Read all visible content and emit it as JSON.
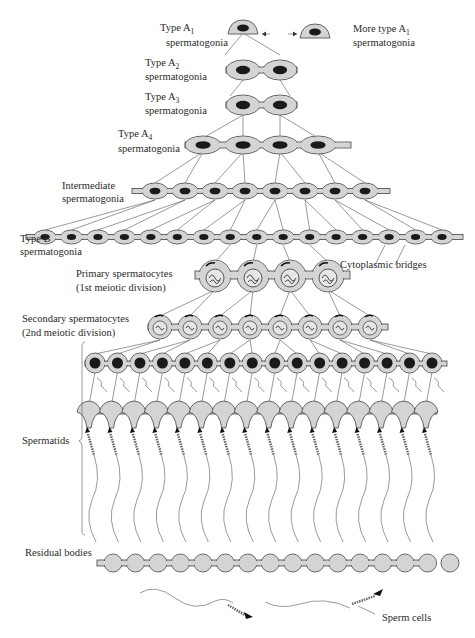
{
  "labels": {
    "type_a1": {
      "line1": "Type A",
      "sub": "1",
      "line2": "spermatogonia"
    },
    "or": "or",
    "more_type_a1": {
      "line1": "More type A",
      "sub": "1",
      "line2": "spermatogonia"
    },
    "type_a2": {
      "line1": "Type A",
      "sub": "2",
      "line2": "spermatogonia"
    },
    "type_a3": {
      "line1": "Type A",
      "sub": "3",
      "line2": "spermatogonia"
    },
    "type_a4": {
      "line1": "Type A",
      "sub": "4",
      "line2": "spermatogonia"
    },
    "intermediate": {
      "line1": "Intermediate",
      "line2": "spermatogonia"
    },
    "type_b": {
      "line1": "Type B",
      "line2": "spermatogonia"
    },
    "cytoplasmic_bridges": "Cytoplasmic bridges",
    "primary": {
      "line1": "Primary spermatocytes",
      "line2": "(1st meiotic division)"
    },
    "secondary": {
      "line1": "Secondary spermatocytes",
      "line2": "(2nd meiotic division)"
    },
    "spermatids": "Spermatids",
    "residual_bodies": "Residual bodies",
    "sperm_cells": "Sperm cells"
  },
  "rows": [
    {
      "stage": "Type A1 spermatogonia",
      "count": 1
    },
    {
      "stage": "Type A2 spermatogonia",
      "count": 2
    },
    {
      "stage": "Type A3 spermatogonia",
      "count": 2
    },
    {
      "stage": "Type A4 spermatogonia",
      "count": 4
    },
    {
      "stage": "Intermediate spermatogonia",
      "count": 8
    },
    {
      "stage": "Type B spermatogonia",
      "count": 16
    },
    {
      "stage": "Primary spermatocytes",
      "count": 4
    },
    {
      "stage": "Secondary spermatocytes",
      "count": 8
    },
    {
      "stage": "Spermatids (round)",
      "count": 16
    },
    {
      "stage": "Spermatids (elongating)",
      "count": 16
    },
    {
      "stage": "Residual bodies",
      "count": 16
    },
    {
      "stage": "Sperm cells",
      "count": 2
    }
  ],
  "colors": {
    "cell_fill": "#d4d4d4",
    "outline": "#444444",
    "nucleus": "#1a1a1a",
    "background": "#ffffff"
  }
}
